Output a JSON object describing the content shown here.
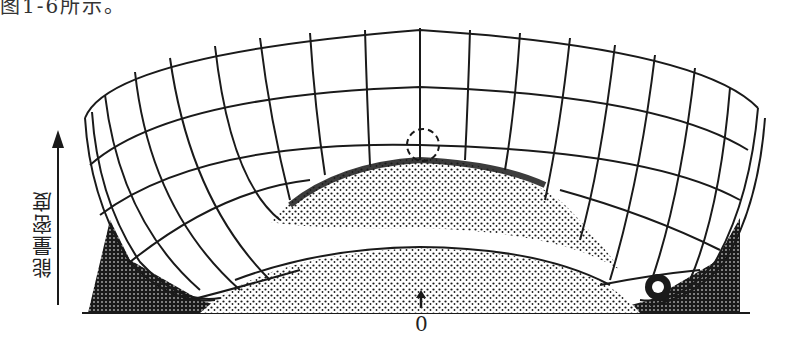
{
  "caption_fragment": "图1-6所示。",
  "diagram": {
    "type": "energy-density-potential-surface",
    "y_axis_label": "能量密度",
    "origin_label": "0",
    "features": [
      "bowl-shaped grid surface (mexican-hat potential)",
      "dashed circle marking unstable maximum at center top",
      "ball resting in minimum at lower right",
      "stippled shading beneath surface",
      "upward arrow at origin"
    ],
    "colors": {
      "ink": "#1a1a1a",
      "paper": "#ffffff"
    }
  }
}
